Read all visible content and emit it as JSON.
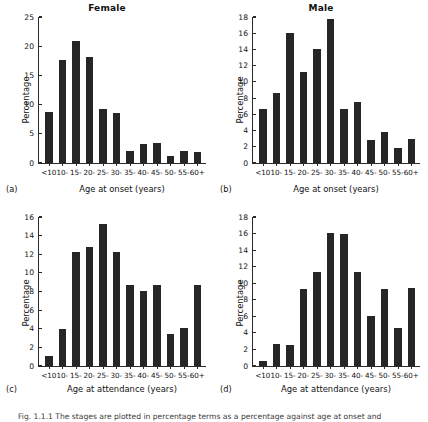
{
  "figure": {
    "caption": "Fig. 1.1.1 The stages are plotted in percentage terms as a percentage against age at onset and"
  },
  "panels": [
    {
      "key": "a",
      "letter": "(a)",
      "title": "Female",
      "ylabel": "Percentage",
      "xlabel": "Age at onset (years)"
    },
    {
      "key": "b",
      "letter": "(b)",
      "title": "Male",
      "ylabel": "Percentage",
      "xlabel": "Age at onset (years)"
    },
    {
      "key": "c",
      "letter": "(c)",
      "title": "",
      "ylabel": "Percentage",
      "xlabel": "Age at attendance (years)"
    },
    {
      "key": "d",
      "letter": "(d)",
      "title": "",
      "ylabel": "Percentage",
      "xlabel": "Age at attendance (years)"
    }
  ],
  "chart_data": [
    {
      "id": "a",
      "type": "bar",
      "title": "Female",
      "panel_label": "(a)",
      "xlabel": "Age at onset (years)",
      "ylabel": "Percentage",
      "categories": [
        "<10",
        "10-",
        "15-",
        "20-",
        "25-",
        "30-",
        "35-",
        "40-",
        "45-",
        "50-",
        "55-",
        "60+"
      ],
      "values": [
        8.7,
        17.7,
        20.9,
        18.2,
        9.2,
        8.6,
        2.1,
        3.3,
        3.5,
        1.2,
        2.0,
        1.9
      ],
      "yticks": [
        0,
        5,
        10,
        15,
        20,
        25
      ],
      "ylim": [
        0,
        25
      ],
      "grid": false,
      "legend": "none",
      "bar_color": "#262626"
    },
    {
      "id": "b",
      "type": "bar",
      "title": "Male",
      "panel_label": "(b)",
      "xlabel": "Age at onset (years)",
      "ylabel": "Percentage",
      "categories": [
        "<10",
        "10-",
        "15-",
        "20-",
        "25-",
        "30-",
        "35-",
        "40-",
        "45-",
        "50-",
        "55-",
        "60+"
      ],
      "values": [
        6.6,
        8.6,
        16.0,
        11.2,
        14.0,
        17.8,
        6.6,
        7.5,
        2.8,
        3.8,
        1.9,
        3.0
      ],
      "yticks": [
        0,
        2,
        4,
        6,
        8,
        10,
        12,
        14,
        16,
        18
      ],
      "ylim": [
        0,
        18
      ],
      "grid": false,
      "legend": "none",
      "bar_color": "#262626"
    },
    {
      "id": "c",
      "type": "bar",
      "title": "",
      "panel_label": "(c)",
      "xlabel": "Age at attendance (years)",
      "ylabel": "Percentage",
      "categories": [
        "<10",
        "10-",
        "15-",
        "20-",
        "25-",
        "30-",
        "35-",
        "40-",
        "45-",
        "50-",
        "55-",
        "60+"
      ],
      "values": [
        1.1,
        4.0,
        12.2,
        12.8,
        15.3,
        12.2,
        8.7,
        8.1,
        8.7,
        3.4,
        4.1,
        8.7
      ],
      "yticks": [
        0,
        2,
        4,
        6,
        8,
        10,
        12,
        14,
        16
      ],
      "ylim": [
        0,
        16
      ],
      "grid": false,
      "legend": "none",
      "bar_color": "#262626"
    },
    {
      "id": "d",
      "type": "bar",
      "title": "",
      "panel_label": "(d)",
      "xlabel": "Age at attendance (years)",
      "ylabel": "Percentage",
      "categories": [
        "<10",
        "10-",
        "15-",
        "20-",
        "25-",
        "30-",
        "35-",
        "40-",
        "45-",
        "50-",
        "55-",
        "60+"
      ],
      "values": [
        0.6,
        2.6,
        2.5,
        9.3,
        11.4,
        16.1,
        16.0,
        11.4,
        6.0,
        9.3,
        4.6,
        9.4
      ],
      "yticks": [
        0,
        2,
        4,
        6,
        8,
        10,
        12,
        14,
        16,
        18
      ],
      "ylim": [
        0,
        18
      ],
      "grid": false,
      "legend": "none",
      "bar_color": "#262626"
    }
  ]
}
